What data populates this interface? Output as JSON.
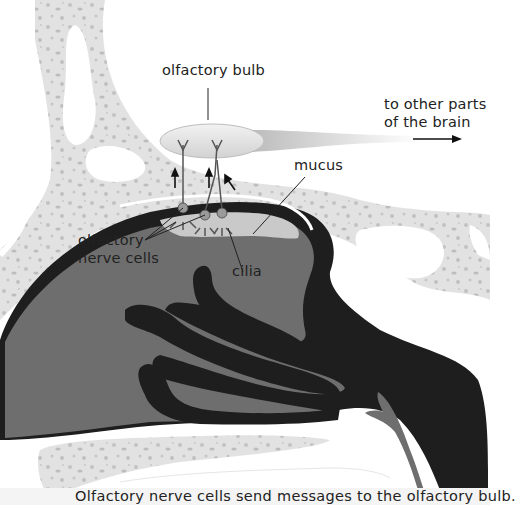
{
  "diagram": {
    "labels": {
      "olfactory_bulb": "olfactory bulb",
      "other_parts_line1": "to other parts",
      "other_parts_line2": "of the brain",
      "mucus": "mucus",
      "nerve_cells_line1": "olfactory",
      "nerve_cells_line2": "nerve cells",
      "cilia": "cilia"
    },
    "caption": "Olfactory nerve cells send messages to the olfactory bulb."
  },
  "colors": {
    "bone": "#e2e2e2",
    "bone_spots": "#bdbdbd",
    "cavity_dark": "#1e1e1e",
    "tissue_gray": "#6e6e6e",
    "mucus": "#c9c9c9",
    "bulb": "#e6e6e6",
    "text": "#222222"
  }
}
